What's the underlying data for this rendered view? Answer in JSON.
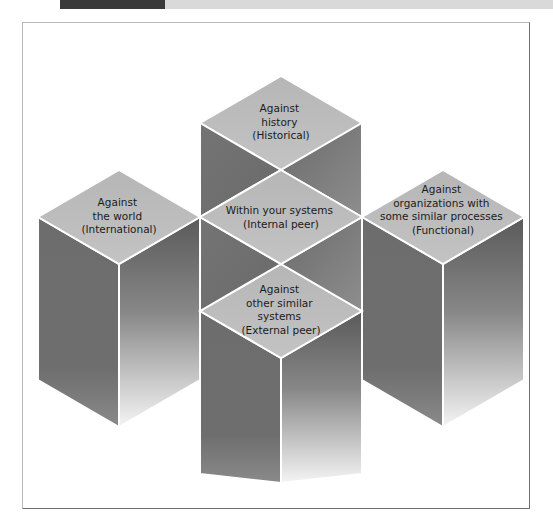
{
  "header": {
    "strip_label": "",
    "colors": {
      "dark": "#3a3a3a",
      "light": "#d9d9d9"
    }
  },
  "figure": {
    "name": "benchmarking-comparison-cubes",
    "frame_border_color": "#b9b9b9",
    "frame_shadow_color": "#6e6e6e",
    "background": "#ffffff"
  },
  "palette": {
    "top_face": "#bcbcbc",
    "left_face": "#6f6f6f",
    "right_face_top": "#5e5e5e",
    "right_face_bottom": "#f2f2f2",
    "edge": "#ffffff",
    "text": "#1b1b1b"
  },
  "diagram": {
    "type": "isometric-cube-cluster",
    "cube_count": 5,
    "cubes": [
      {
        "id": "historical",
        "position": "top",
        "lines": [
          "Against",
          "history",
          "(Historical)"
        ]
      },
      {
        "id": "international",
        "position": "left",
        "lines": [
          "Against",
          "the world",
          "(International)"
        ]
      },
      {
        "id": "internal-peer",
        "position": "center",
        "lines": [
          "Within your systems",
          "(Internal peer)"
        ]
      },
      {
        "id": "functional",
        "position": "right",
        "lines": [
          "Against",
          "organizations with",
          "some similar processes",
          "(Functional)"
        ]
      },
      {
        "id": "external-peer",
        "position": "bottom",
        "lines": [
          "Against",
          "other similar",
          "systems",
          "(External peer)"
        ]
      }
    ]
  }
}
